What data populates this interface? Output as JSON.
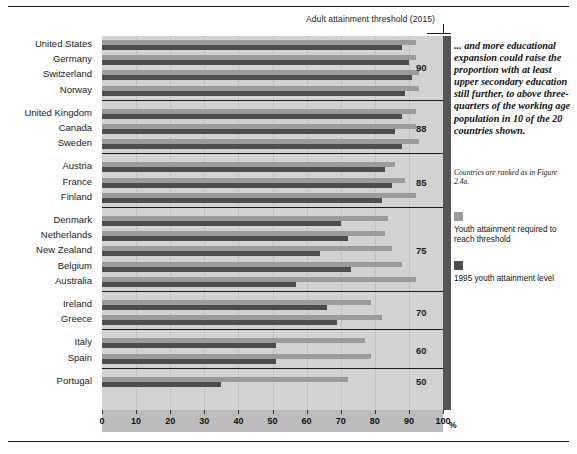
{
  "figure": {
    "threshold_title": "Adult attainment threshold (2015)",
    "x_axis": {
      "unit": "%",
      "ticks": [
        0,
        10,
        20,
        30,
        40,
        50,
        60,
        70,
        80,
        90,
        100
      ],
      "min": 0,
      "max": 100
    },
    "callout": "... and more educational expansion could raise the proportion with at least upper secondary education still further, to above three-quarters of the working age population in 10 of the 20 countries shown.",
    "note": "Countries are ranked as in Figure 2.4a.",
    "legend": [
      {
        "key": "legend-swatch-required",
        "color": "#9b9b9b",
        "label": "Youth attainment required to reach threshold"
      },
      {
        "key": "legend-swatch-1995",
        "color": "#4d4d4d",
        "label": "1995 youth attainment level"
      }
    ]
  },
  "chart_data": {
    "type": "bar",
    "orientation": "horizontal",
    "title": "Adult attainment threshold (2015)",
    "xlabel": "%",
    "ylabel": "",
    "xlim": [
      0,
      100
    ],
    "grid": true,
    "legend_position": "right",
    "series": [
      {
        "name": "Youth attainment required to reach threshold",
        "color": "#9b9b9b",
        "values": [
          92,
          92,
          93,
          93,
          92,
          92,
          93,
          86,
          89,
          92,
          84,
          83,
          85,
          88,
          92,
          79,
          82,
          77,
          79,
          72
        ]
      },
      {
        "name": "1995 youth attainment level",
        "color": "#4d4d4d",
        "values": [
          88,
          90,
          91,
          89,
          88,
          86,
          88,
          83,
          85,
          82,
          70,
          72,
          64,
          73,
          57,
          66,
          69,
          51,
          51,
          35
        ]
      }
    ],
    "categories": [
      "United States",
      "Germany",
      "Switzerland",
      "Norway",
      "United Kingdom",
      "Canada",
      "Sweden",
      "Austria",
      "France",
      "Finland",
      "Denmark",
      "Netherlands",
      "New Zealand",
      "Belgium",
      "Australia",
      "Ireland",
      "Greece",
      "Italy",
      "Spain",
      "Portugal"
    ],
    "groups": [
      {
        "threshold": "90",
        "countries": [
          "United States",
          "Germany",
          "Switzerland",
          "Norway"
        ]
      },
      {
        "threshold": "88",
        "countries": [
          "United Kingdom",
          "Canada",
          "Sweden"
        ]
      },
      {
        "threshold": "85",
        "countries": [
          "Austria",
          "France",
          "Finland"
        ]
      },
      {
        "threshold": "75",
        "countries": [
          "Denmark",
          "Netherlands",
          "New Zealand",
          "Belgium",
          "Australia"
        ]
      },
      {
        "threshold": "70",
        "countries": [
          "Ireland",
          "Greece"
        ]
      },
      {
        "threshold": "60",
        "countries": [
          "Italy",
          "Spain"
        ]
      },
      {
        "threshold": "50",
        "countries": [
          "Portugal"
        ]
      }
    ]
  }
}
